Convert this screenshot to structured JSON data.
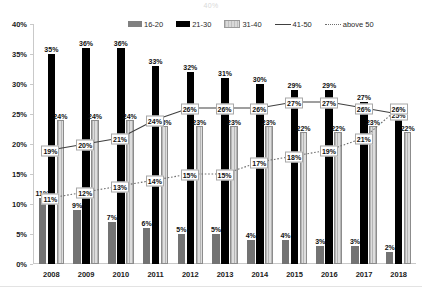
{
  "title_strip": "40%",
  "chart_data": {
    "type": "bar",
    "title": "",
    "xlabel": "",
    "ylabel": "",
    "ylim": [
      0,
      40
    ],
    "ytick_labels": [
      "0%",
      "5%",
      "10%",
      "15%",
      "20%",
      "25%",
      "30%",
      "35%",
      "40%"
    ],
    "ytick_values": [
      0,
      5,
      10,
      15,
      20,
      25,
      30,
      35,
      40
    ],
    "grid": false,
    "legend_position": "top",
    "categories": [
      "2008",
      "2009",
      "2010",
      "2011",
      "2012",
      "2013",
      "2014",
      "2015",
      "2016",
      "2017",
      "2018"
    ],
    "series": [
      {
        "name": "16-20",
        "kind": "bar",
        "color": "#737373",
        "values": [
          11,
          9,
          7,
          6,
          5,
          5,
          4,
          4,
          3,
          3,
          2
        ],
        "labels": [
          "11%",
          "9%",
          "7%",
          "6%",
          "5%",
          "5%",
          "4%",
          "4%",
          "3%",
          "3%",
          "2%"
        ]
      },
      {
        "name": "21-30",
        "kind": "bar",
        "color": "#000000",
        "values": [
          35,
          36,
          36,
          33,
          32,
          31,
          30,
          29,
          29,
          27,
          25
        ],
        "labels": [
          "35%",
          "36%",
          "36%",
          "33%",
          "32%",
          "31%",
          "30%",
          "29%",
          "29%",
          "27%",
          "25%"
        ]
      },
      {
        "name": "31-40",
        "kind": "bar",
        "color": "#dddddd",
        "values": [
          24,
          24,
          24,
          23,
          23,
          23,
          23,
          22,
          22,
          23,
          22
        ],
        "labels": [
          "24%",
          "24%",
          "24%",
          "23%",
          "23%",
          "23%",
          "23%",
          "22%",
          "22%",
          "23%",
          "22%"
        ]
      },
      {
        "name": "41-50",
        "kind": "line",
        "color": "#404040",
        "style": "solid",
        "values": [
          19,
          20,
          21,
          24,
          26,
          26,
          26,
          27,
          27,
          26,
          25
        ],
        "labels": [
          "19%",
          "20%",
          "21%",
          "24%",
          "26%",
          "26%",
          "26%",
          "27%",
          "27%",
          "26%",
          "25%"
        ]
      },
      {
        "name": "above 50",
        "kind": "line",
        "color": "#6e6e6e",
        "style": "dotted",
        "values": [
          11,
          12,
          13,
          14,
          15,
          15,
          17,
          18,
          19,
          21,
          26
        ],
        "labels": [
          "11%",
          "12%",
          "13%",
          "14%",
          "15%",
          "15%",
          "17%",
          "18%",
          "19%",
          "21%",
          "26%"
        ]
      }
    ]
  },
  "legend": {
    "items": [
      {
        "label": "16-20"
      },
      {
        "label": "21-30"
      },
      {
        "label": "31-40"
      },
      {
        "label": "41-50"
      },
      {
        "label": "above 50"
      }
    ]
  }
}
